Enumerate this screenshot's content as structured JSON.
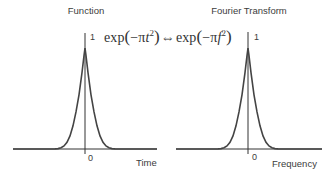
{
  "figure": {
    "left_panel": {
      "title": "Function",
      "x_label": "Time",
      "origin_label": "0",
      "peak_label": "1"
    },
    "right_panel": {
      "title": "Fourier Transform",
      "x_label": "Frequency",
      "origin_label": "0",
      "peak_label": "1"
    },
    "formula": {
      "text": "exp(−πt²) ⇔ exp(−πf²)",
      "lhs": "exp(−πt²)",
      "relation": "⇔",
      "rhs": "exp(−πf²)"
    },
    "colors": {
      "curve": "#444444",
      "axis": "#333333",
      "text": "#3c3c3c"
    }
  }
}
